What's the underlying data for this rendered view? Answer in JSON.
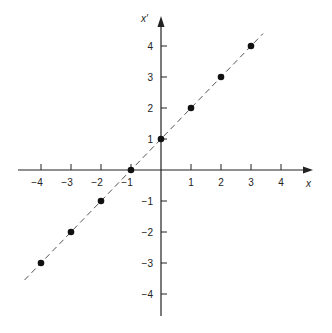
{
  "chart_data": {
    "type": "scatter",
    "title": "",
    "xlabel": "x",
    "ylabel": "x′",
    "xlim": [
      -4.6,
      5.0
    ],
    "ylim": [
      -4.6,
      4.8
    ],
    "grid": false,
    "x_ticks": [
      -4,
      -3,
      -2,
      -1,
      1,
      2,
      3,
      4
    ],
    "y_ticks": [
      -4,
      -3,
      -2,
      -1,
      1,
      2,
      3,
      4
    ],
    "x_tick_labels": [
      "−4",
      "−3",
      "−2",
      "−1",
      "1",
      "2",
      "3",
      "4"
    ],
    "y_tick_labels": [
      "−4",
      "−3",
      "−2",
      "−1",
      "1",
      "2",
      "3",
      "4"
    ],
    "series": [
      {
        "name": "points",
        "points": [
          {
            "x": -4,
            "y": -3
          },
          {
            "x": -3,
            "y": -2
          },
          {
            "x": -2,
            "y": -1
          },
          {
            "x": -1,
            "y": 0
          },
          {
            "x": 0,
            "y": 1
          },
          {
            "x": 1,
            "y": 2
          },
          {
            "x": 2,
            "y": 3
          },
          {
            "x": 3,
            "y": 4
          }
        ]
      }
    ],
    "line": {
      "equation": "x′ = x + 1",
      "style": "dashed",
      "from": {
        "x": -4.55,
        "y": -3.55
      },
      "to": {
        "x": 3.4,
        "y": 4.4
      }
    }
  },
  "colors": {
    "axis": "#222222",
    "line": "#555555",
    "point": "#111111"
  }
}
